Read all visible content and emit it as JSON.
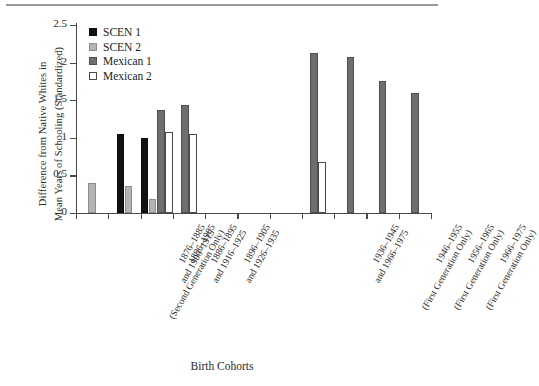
{
  "chart_data": {
    "type": "bar",
    "title": "",
    "xlabel": "Birth Cohorts",
    "ylabel": "Difference from Native Whites in Mean Years of Schooling (Standardized)",
    "ylabel_line1": "Difference from Native Whites in",
    "ylabel_line2": "Mean Years of Schooling (Standardized)",
    "ylim": [
      0,
      2.5
    ],
    "yticks": [
      "0",
      "0.5",
      "1",
      "1.5",
      "2",
      "2.5"
    ],
    "ytick_values": [
      0,
      0.5,
      1,
      1.5,
      2,
      2.5
    ],
    "grid": false,
    "legend_position": "top-left",
    "legend": [
      {
        "name": "SCEN 1",
        "color": "#121212",
        "key": "scen1"
      },
      {
        "name": "SCEN 2",
        "color": "#b4b4b4",
        "key": "scen2"
      },
      {
        "name": "Mexican 1",
        "color": "#6e6e6e",
        "key": "mex1"
      },
      {
        "name": "Mexican 2",
        "color": "#ffffff",
        "key": "mex2"
      }
    ],
    "categories": [
      "1896–1905 (Second Generation Only)",
      "1876–1885 and 1906–1915",
      "1886–1895 and 1916–1925",
      "1896–1905 and 1926–1935",
      "",
      "",
      "",
      "1936–1945 and 1966–1975",
      "1946–1955 (First Generation Only)",
      "1956–1965 (First Generation Only)",
      "1966–1975 (First Generation Only)"
    ],
    "category_labels": [
      {
        "lines": [
          "1896–1905",
          "(Second Generation Only)"
        ]
      },
      {
        "lines": [
          "1876–1885",
          "and 1906–1915"
        ]
      },
      {
        "lines": [
          "1886–1895",
          "and 1916–1925"
        ]
      },
      {
        "lines": [
          "1896–1905",
          "and 1926–1935"
        ]
      },
      {
        "lines": [
          ""
        ]
      },
      {
        "lines": [
          ""
        ]
      },
      {
        "lines": [
          ""
        ]
      },
      {
        "lines": [
          "1936–1945",
          "and 1966–1975"
        ]
      },
      {
        "lines": [
          "1946–1955",
          "(First Generation Only)"
        ]
      },
      {
        "lines": [
          "1956–1965",
          "(First Generation Only)"
        ]
      },
      {
        "lines": [
          "1966–1975",
          "(First Generation Only)"
        ]
      }
    ],
    "series": [
      {
        "name": "SCEN 1",
        "key": "scen1",
        "values": [
          null,
          1.05,
          1.0,
          null,
          null,
          null,
          null,
          null,
          null,
          null,
          null
        ]
      },
      {
        "name": "SCEN 2",
        "key": "scen2",
        "values": [
          0.4,
          0.36,
          0.19,
          null,
          null,
          null,
          null,
          null,
          null,
          null,
          null
        ]
      },
      {
        "name": "Mexican 1",
        "key": "mex1",
        "values": [
          null,
          null,
          1.37,
          1.43,
          null,
          null,
          null,
          2.13,
          2.07,
          1.76,
          1.59
        ]
      },
      {
        "name": "Mexican 2",
        "key": "mex2",
        "values": [
          null,
          null,
          1.08,
          1.05,
          null,
          null,
          null,
          0.68,
          null,
          null,
          null
        ]
      }
    ]
  }
}
